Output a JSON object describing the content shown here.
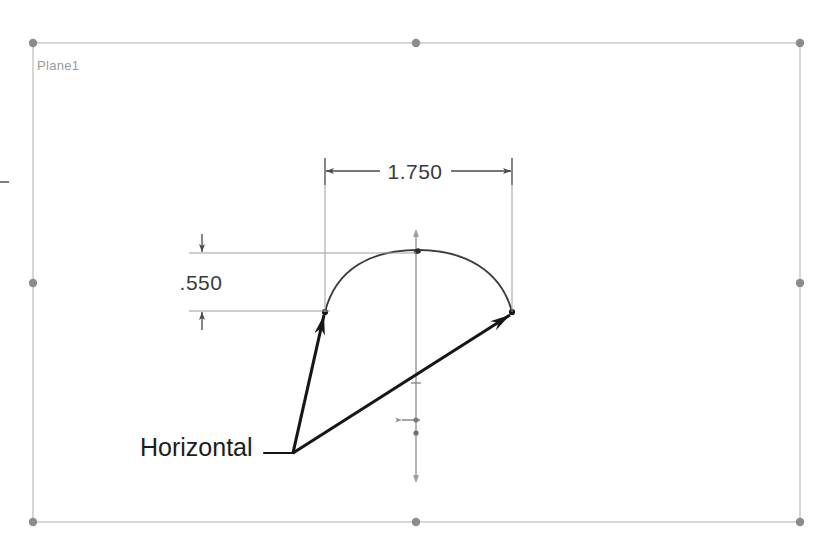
{
  "app": {
    "kind": "cad-sketch-viewport",
    "background_color": "#ffffff"
  },
  "plane": {
    "label": "Plane1",
    "label_color": "#9a9a9a",
    "border_color": "#b9b9b9",
    "handle_color": "#8a8a8a",
    "rect": {
      "x": 33,
      "y": 43,
      "width": 767,
      "height": 479
    }
  },
  "geometry": {
    "arc": {
      "name": "sketch-arc",
      "color": "#3c3c3c",
      "start": {
        "x": 325,
        "y": 312
      },
      "end": {
        "x": 512,
        "y": 312
      },
      "apex": {
        "x": 418,
        "y": 252
      }
    },
    "centerline": {
      "name": "vertical-centerline",
      "color": "#9c9c9c",
      "x": 416,
      "top_y": 231,
      "bottom_y": 481
    }
  },
  "dimensions": [
    {
      "id": "horizontal-dimension",
      "value": "1.750",
      "orientation": "horizontal",
      "text_color": "#3a3a3a",
      "line_color": "#4a4a4a",
      "dim_line_y": 171,
      "from_x": 325,
      "to_x": 512,
      "ext_top_y": 158,
      "ext_bottom_y": 312
    },
    {
      "id": "vertical-dimension",
      "value": ".550",
      "orientation": "vertical",
      "text_color": "#3a3a3a",
      "line_color": "#4a4a4a",
      "dim_line_x": 202,
      "from_y": 253,
      "to_y": 311,
      "ext_left_x": 189,
      "ext_right_upper_x": 416,
      "ext_right_lower_x": 325
    }
  ],
  "annotation": {
    "id": "horizontal-relation-callout",
    "label": "Horizontal",
    "text_color": "#1c1c1c",
    "leader_color": "#1c1c1c",
    "text_anchor": {
      "x": 140,
      "y": 456
    },
    "leader_start": {
      "x": 264,
      "y": 453
    },
    "leader_elbow": {
      "x": 293,
      "y": 453
    },
    "arrow_targets": [
      {
        "x": 325,
        "y": 312
      },
      {
        "x": 512,
        "y": 312
      }
    ]
  },
  "handles": [
    {
      "name": "plane-handle-top-left",
      "x": 33,
      "y": 43
    },
    {
      "name": "plane-handle-top-middle",
      "x": 416,
      "y": 43
    },
    {
      "name": "plane-handle-top-right",
      "x": 800,
      "y": 43
    },
    {
      "name": "plane-handle-left-middle",
      "x": 33,
      "y": 283
    },
    {
      "name": "plane-handle-right-middle",
      "x": 800,
      "y": 283
    },
    {
      "name": "plane-handle-bottom-left",
      "x": 33,
      "y": 522
    },
    {
      "name": "plane-handle-bottom-middle",
      "x": 416,
      "y": 522
    },
    {
      "name": "plane-handle-bottom-right",
      "x": 800,
      "y": 522
    }
  ],
  "sketch_points": [
    {
      "name": "arc-endpoint-left",
      "x": 325,
      "y": 312
    },
    {
      "name": "arc-endpoint-right",
      "x": 512,
      "y": 312
    },
    {
      "name": "arc-apex-point",
      "x": 418,
      "y": 252
    },
    {
      "name": "centerline-point-upper",
      "x": 416,
      "y": 420
    },
    {
      "name": "centerline-point-lower",
      "x": 416,
      "y": 432
    }
  ]
}
